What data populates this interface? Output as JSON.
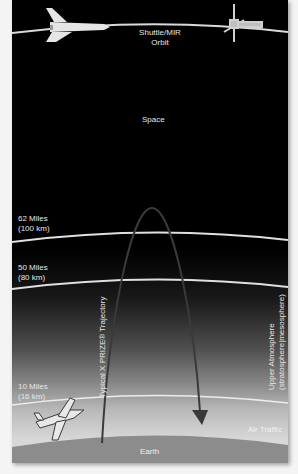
{
  "diagram": {
    "title_labels": {
      "orbit": [
        "Shuttle/MIR",
        "Orbit"
      ],
      "space": "Space",
      "earth": "Earth",
      "air_traffic": "Air Traffic"
    },
    "altitudes": [
      {
        "line1": "62 Miles",
        "line2": "(100 km)"
      },
      {
        "line1": "50 Miles",
        "line2": "(80 km)"
      },
      {
        "line1": "10 Miles",
        "line2": "(16 km)"
      }
    ],
    "trajectory_label": "Typical X PRIZE® Trajectory",
    "atmosphere_label": {
      "line1": "Upper Atmosphere",
      "line2": "(stratosphere|mesosphere)"
    },
    "icons": [
      "space-shuttle-icon",
      "space-station-icon",
      "airplane-icon",
      "trajectory-arrow-icon"
    ],
    "colors": {
      "space": "#000000",
      "orbit_lines": "#d9d9d9",
      "earth": "#8c8c8c",
      "trajectory": "#3a3a3a",
      "labels": "#e6e6e6"
    }
  }
}
